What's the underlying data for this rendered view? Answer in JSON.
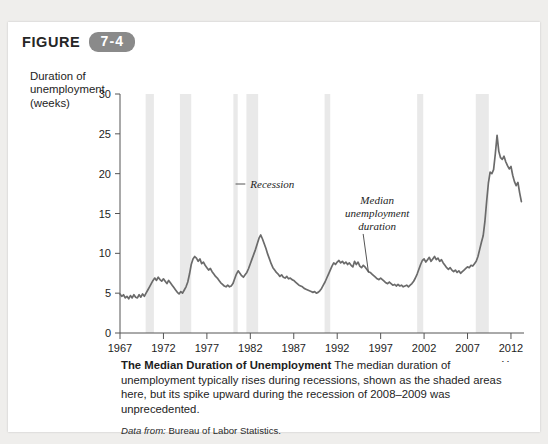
{
  "figure": {
    "word": "FIGURE",
    "number": "7-4"
  },
  "axis_title_lines": [
    "Duration of",
    "unemployment",
    "(weeks)"
  ],
  "caption": {
    "lead": "The Median Duration of Unemployment",
    "body": " The median duration of unemployment typically rises during recessions, shown as the shaded areas here, but its spike upward during the recession of 2008–2009 was unprecedented.",
    "source_label": "Data from:",
    "source_value": " Bureau of Labor Statistics."
  },
  "colors": {
    "line": "#6b6b6b",
    "recession_band": "#e9e9e9",
    "axis": "#555555",
    "badge": "#8a8a8a",
    "panel": "#ffffff",
    "page": "#efeeec"
  },
  "chart_data": {
    "type": "line",
    "title": "The Median Duration of Unemployment",
    "xlabel": "Year",
    "ylabel": "Duration of unemployment (weeks)",
    "xlim": [
      1967,
      2013.5
    ],
    "ylim": [
      0,
      30
    ],
    "xticks": [
      1967,
      1972,
      1977,
      1982,
      1987,
      1992,
      1997,
      2002,
      2007,
      2012
    ],
    "yticks": [
      0,
      5,
      10,
      15,
      20,
      25,
      30
    ],
    "grid": false,
    "legend": "none",
    "annotations": [
      {
        "name": "recession",
        "lines": [
          "Recession"
        ],
        "text_x": 1982.0,
        "text_y": 18.2,
        "leader_to_x": 1980.3,
        "leader_to_y": 18.2
      },
      {
        "name": "median-unemployment-duration",
        "lines": [
          "Median",
          "unemployment",
          "duration"
        ],
        "text_x": 1996.6,
        "text_y": 16.2,
        "leader_to_x": 1995.6,
        "leader_to_y": 7.6
      }
    ],
    "recession_bands": [
      {
        "start": 1969.95,
        "end": 1970.9
      },
      {
        "start": 1973.9,
        "end": 1975.2
      },
      {
        "start": 1980.05,
        "end": 1980.55
      },
      {
        "start": 1981.55,
        "end": 1982.9
      },
      {
        "start": 1990.55,
        "end": 1991.2
      },
      {
        "start": 2001.2,
        "end": 2001.9
      },
      {
        "start": 2007.95,
        "end": 2009.45
      }
    ],
    "series": [
      {
        "name": "Median unemployment duration",
        "x": [
          1967.0,
          1967.2,
          1967.4,
          1967.6,
          1967.8,
          1968.0,
          1968.2,
          1968.4,
          1968.6,
          1968.8,
          1969.0,
          1969.2,
          1969.4,
          1969.6,
          1969.8,
          1970.0,
          1970.2,
          1970.4,
          1970.6,
          1970.8,
          1971.0,
          1971.2,
          1971.4,
          1971.6,
          1971.8,
          1972.0,
          1972.2,
          1972.4,
          1972.6,
          1972.8,
          1973.0,
          1973.2,
          1973.4,
          1973.6,
          1973.8,
          1974.0,
          1974.2,
          1974.4,
          1974.6,
          1974.8,
          1975.0,
          1975.2,
          1975.4,
          1975.6,
          1975.8,
          1976.0,
          1976.2,
          1976.4,
          1976.6,
          1976.8,
          1977.0,
          1977.2,
          1977.4,
          1977.6,
          1977.8,
          1978.0,
          1978.2,
          1978.4,
          1978.6,
          1978.8,
          1979.0,
          1979.2,
          1979.4,
          1979.6,
          1979.8,
          1980.0,
          1980.2,
          1980.4,
          1980.6,
          1980.8,
          1981.0,
          1981.2,
          1981.4,
          1981.6,
          1981.8,
          1982.0,
          1982.2,
          1982.4,
          1982.6,
          1982.8,
          1983.0,
          1983.2,
          1983.4,
          1983.6,
          1983.8,
          1984.0,
          1984.2,
          1984.4,
          1984.6,
          1984.8,
          1985.0,
          1985.2,
          1985.4,
          1985.6,
          1985.8,
          1986.0,
          1986.2,
          1986.4,
          1986.6,
          1986.8,
          1987.0,
          1987.2,
          1987.4,
          1987.6,
          1987.8,
          1988.0,
          1988.2,
          1988.4,
          1988.6,
          1988.8,
          1989.0,
          1989.2,
          1989.4,
          1989.6,
          1989.8,
          1990.0,
          1990.2,
          1990.4,
          1990.6,
          1990.8,
          1991.0,
          1991.2,
          1991.4,
          1991.6,
          1991.8,
          1992.0,
          1992.2,
          1992.4,
          1992.6,
          1992.8,
          1993.0,
          1993.2,
          1993.4,
          1993.6,
          1993.8,
          1994.0,
          1994.2,
          1994.4,
          1994.6,
          1994.8,
          1995.0,
          1995.2,
          1995.4,
          1995.6,
          1995.8,
          1996.0,
          1996.2,
          1996.4,
          1996.6,
          1996.8,
          1997.0,
          1997.2,
          1997.4,
          1997.6,
          1997.8,
          1998.0,
          1998.2,
          1998.4,
          1998.6,
          1998.8,
          1999.0,
          1999.2,
          1999.4,
          1999.6,
          1999.8,
          2000.0,
          2000.2,
          2000.4,
          2000.6,
          2000.8,
          2001.0,
          2001.2,
          2001.4,
          2001.6,
          2001.8,
          2002.0,
          2002.2,
          2002.4,
          2002.6,
          2002.8,
          2003.0,
          2003.2,
          2003.4,
          2003.6,
          2003.8,
          2004.0,
          2004.2,
          2004.4,
          2004.6,
          2004.8,
          2005.0,
          2005.2,
          2005.4,
          2005.6,
          2005.8,
          2006.0,
          2006.2,
          2006.4,
          2006.6,
          2006.8,
          2007.0,
          2007.2,
          2007.4,
          2007.6,
          2007.8,
          2008.0,
          2008.2,
          2008.4,
          2008.6,
          2008.8,
          2009.0,
          2009.2,
          2009.4,
          2009.6,
          2009.8,
          2010.0,
          2010.2,
          2010.4,
          2010.6,
          2010.8,
          2011.0,
          2011.2,
          2011.4,
          2011.6,
          2011.8,
          2012.0,
          2012.2,
          2012.4,
          2012.6,
          2012.8,
          2013.0,
          2013.2
        ],
        "values": [
          4.9,
          4.6,
          4.8,
          4.4,
          4.6,
          4.3,
          4.7,
          4.4,
          4.8,
          4.5,
          4.4,
          4.8,
          4.5,
          4.9,
          4.6,
          5.0,
          5.4,
          5.8,
          6.2,
          6.6,
          6.9,
          6.6,
          7.0,
          6.7,
          6.5,
          6.8,
          6.5,
          6.2,
          6.6,
          6.3,
          6.0,
          5.7,
          5.4,
          5.1,
          4.9,
          5.2,
          5.0,
          5.4,
          5.8,
          6.4,
          7.4,
          8.6,
          9.3,
          9.6,
          9.4,
          9.0,
          9.3,
          8.7,
          8.9,
          8.5,
          8.2,
          7.9,
          8.1,
          7.7,
          7.4,
          7.1,
          6.9,
          6.6,
          6.3,
          6.1,
          5.9,
          5.8,
          6.0,
          5.8,
          5.9,
          6.2,
          6.8,
          7.4,
          7.8,
          7.5,
          7.2,
          7.0,
          7.3,
          7.6,
          8.1,
          8.7,
          9.3,
          9.9,
          10.5,
          11.2,
          11.9,
          12.3,
          11.8,
          11.2,
          10.6,
          9.9,
          9.3,
          8.7,
          8.2,
          7.9,
          7.6,
          7.4,
          7.1,
          7.3,
          7.0,
          6.9,
          7.1,
          6.8,
          6.9,
          6.7,
          6.6,
          6.4,
          6.2,
          6.0,
          5.9,
          5.8,
          5.6,
          5.5,
          5.4,
          5.3,
          5.2,
          5.1,
          5.2,
          5.0,
          5.1,
          5.3,
          5.6,
          6.0,
          6.4,
          6.9,
          7.4,
          7.9,
          8.4,
          8.8,
          8.6,
          8.9,
          9.1,
          8.8,
          9.0,
          8.7,
          8.9,
          8.6,
          8.8,
          8.5,
          8.3,
          9.0,
          8.6,
          8.9,
          8.4,
          8.2,
          8.5,
          8.3,
          8.0,
          7.7,
          7.6,
          7.4,
          7.2,
          7.0,
          6.8,
          6.7,
          6.9,
          6.7,
          6.5,
          6.3,
          6.2,
          6.4,
          6.2,
          6.0,
          6.1,
          5.9,
          6.1,
          5.9,
          6.0,
          5.8,
          5.9,
          6.0,
          5.8,
          6.0,
          6.2,
          6.5,
          6.9,
          7.4,
          8.0,
          8.6,
          9.1,
          9.3,
          8.9,
          9.2,
          9.5,
          9.0,
          9.3,
          9.6,
          9.2,
          9.4,
          9.0,
          9.2,
          8.8,
          8.5,
          8.2,
          8.0,
          8.2,
          7.9,
          7.7,
          7.9,
          7.6,
          7.8,
          7.5,
          7.7,
          7.9,
          8.1,
          8.3,
          8.2,
          8.5,
          8.4,
          8.7,
          9.0,
          9.6,
          10.5,
          11.4,
          12.2,
          14.0,
          16.5,
          18.8,
          20.2,
          20.0,
          20.5,
          22.5,
          24.8,
          22.8,
          22.0,
          21.8,
          22.2,
          21.5,
          21.0,
          20.6,
          20.9,
          19.8,
          19.0,
          18.5,
          18.9,
          17.6,
          16.5
        ]
      }
    ]
  }
}
